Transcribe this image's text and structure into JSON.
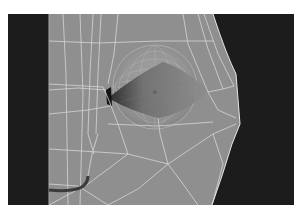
{
  "viewport": {
    "label": "3D viewport",
    "subject": "wireframe eyeball mesh in eye socket",
    "colors": {
      "background": "#1c1c1c",
      "mesh_surface": "#8f8f8f",
      "wireframe": "#d8d8d8",
      "eye_socket_shadow": "#2a2a2a"
    }
  }
}
